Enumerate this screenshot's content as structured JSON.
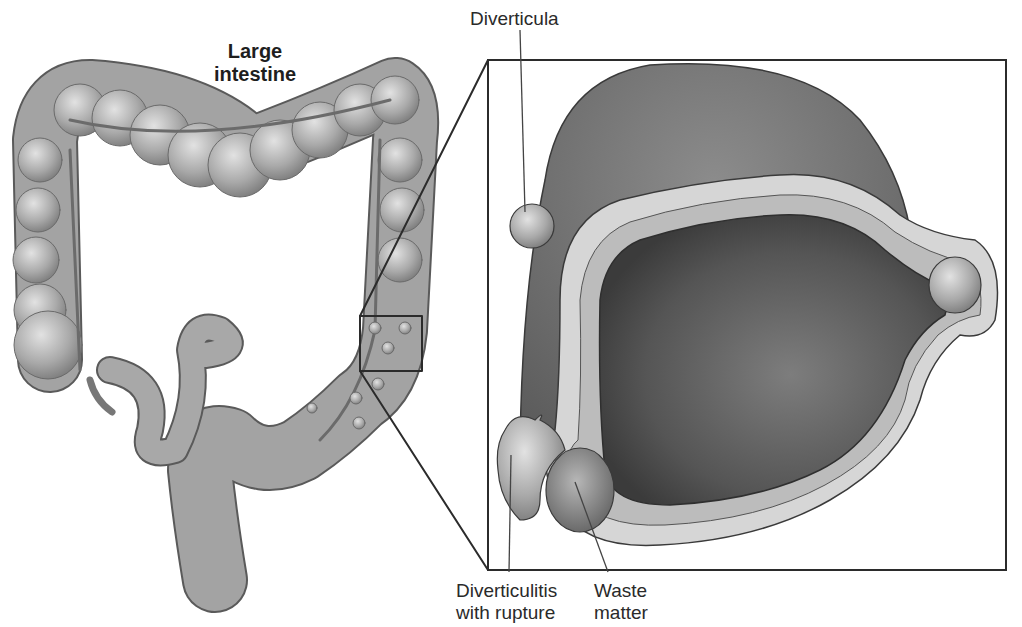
{
  "diagram": {
    "title_line1": "Large",
    "title_line2": "intestine",
    "labels": {
      "diverticula": "Diverticula",
      "diverticulitis_line1": "Diverticulitis",
      "diverticulitis_line2": "with rupture",
      "waste_line1": "Waste",
      "waste_line2": "matter"
    },
    "colors": {
      "tissue": "#9a9a9a",
      "tissue_light": "#c8c8c8",
      "lumen": "#555555",
      "outline": "#3a3a3a",
      "frame": "#2b2b2b"
    }
  }
}
